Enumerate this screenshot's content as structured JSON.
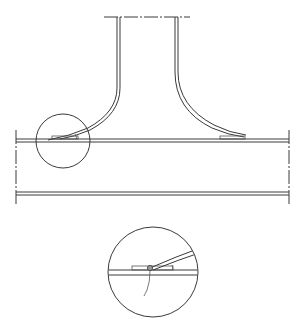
{
  "diagram": {
    "type": "technical-drawing",
    "colors": {
      "line": "#3a3a3a",
      "background": "#ffffff",
      "weld_fill": "#9a9a9a"
    },
    "elements": {
      "branch_pipe": {
        "description": "vertical pipe flaring outward at base"
      },
      "main_pipe": {
        "description": "horizontal pipe with break lines on both ends"
      },
      "detail_circle": {
        "description": "circle marking detail region at left joint"
      },
      "detail_view": {
        "description": "enlarged view of weld joint with leader line"
      }
    },
    "labels": []
  }
}
